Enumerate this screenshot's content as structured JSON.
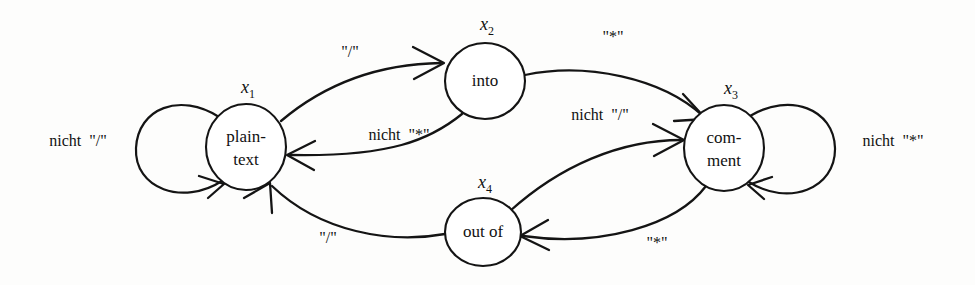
{
  "figure": {
    "kind": "finite-state-machine",
    "ink_color": "#141414",
    "background_color": "#fdfdfc"
  },
  "states": [
    {
      "id": "x1",
      "state_name": "x",
      "state_subscript": "1",
      "label_line1": "plain-",
      "label_line2": "text",
      "cx": 246,
      "cy": 147,
      "rx": 40,
      "ry": 43
    },
    {
      "id": "x2",
      "state_name": "x",
      "state_subscript": "2",
      "label_line1": "into",
      "label_line2": "",
      "cx": 485,
      "cy": 81,
      "rx": 40,
      "ry": 38
    },
    {
      "id": "x3",
      "state_name": "x",
      "state_subscript": "3",
      "label_line1": "com-",
      "label_line2": "ment",
      "cx": 724,
      "cy": 148,
      "rx": 40,
      "ry": 43
    },
    {
      "id": "x4",
      "state_name": "x",
      "state_subscript": "4",
      "label_line1": "out of",
      "label_line2": "",
      "cx": 483,
      "cy": 232,
      "rx": 38,
      "ry": 34
    }
  ],
  "self_loops": [
    {
      "id": "loop-x1",
      "on_state": "x1",
      "side": "left",
      "label": "nicht  \"/\"",
      "label_x": 78,
      "label_y": 146
    },
    {
      "id": "loop-x3",
      "on_state": "x3",
      "side": "right",
      "label": "nicht  \"*\"",
      "label_x": 893,
      "label_y": 146
    }
  ],
  "transitions": [
    {
      "id": "t-x1-x2",
      "from": "x1",
      "to": "x2",
      "label": "\"/\"",
      "label_x": 350,
      "label_y": 57
    },
    {
      "id": "t-x2-x1",
      "from": "x2",
      "to": "x1",
      "label": "nicht  \"*\"",
      "label_x": 399,
      "label_y": 140
    },
    {
      "id": "t-x2-x3",
      "from": "x2",
      "to": "x3",
      "label": "\"*\"",
      "label_x": 613,
      "label_y": 42
    },
    {
      "id": "t-x3-x4",
      "from": "x3",
      "to": "x4",
      "label": "\"*\"",
      "label_x": 657,
      "label_y": 248
    },
    {
      "id": "t-x4-x3",
      "from": "x4",
      "to": "x3",
      "label": "nicht  \"/\"",
      "label_x": 600,
      "label_y": 120
    },
    {
      "id": "t-x4-x1",
      "from": "x4",
      "to": "x1",
      "label": "\"/\"",
      "label_x": 328,
      "label_y": 243
    }
  ]
}
